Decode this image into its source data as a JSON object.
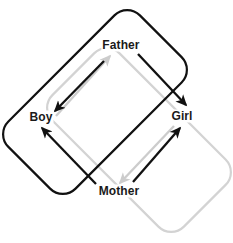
{
  "diagram": {
    "type": "relationship-diagram",
    "background_color": "#ffffff",
    "nodes": [
      {
        "id": "father",
        "label": "Father",
        "x": 121,
        "y": 45
      },
      {
        "id": "boy",
        "label": "Boy",
        "x": 41,
        "y": 117
      },
      {
        "id": "girl",
        "label": "Girl",
        "x": 182,
        "y": 116
      },
      {
        "id": "mother",
        "label": "Mother",
        "x": 119,
        "y": 191
      }
    ],
    "groups": [
      {
        "id": "black-group",
        "color": "#111111",
        "stroke_width": 2.2,
        "rotation_deg": -45,
        "corner_radius": 18,
        "center_x": 95,
        "center_y": 102,
        "width": 186,
        "height": 95
      },
      {
        "id": "gray-group",
        "color": "#d3d3d3",
        "stroke_width": 2.2,
        "rotation_deg": 45,
        "corner_radius": 18,
        "center_x": 139,
        "center_y": 140,
        "width": 186,
        "height": 95
      }
    ],
    "edges": [
      {
        "id": "father-to-boy",
        "from": "Father",
        "to": "Boy",
        "color": "#111111",
        "style": "solid-arrow"
      },
      {
        "id": "boy-to-father",
        "from": "Boy",
        "to": "Father",
        "color": "#cccccc",
        "style": "solid-arrow"
      },
      {
        "id": "father-to-girl",
        "from": "Father",
        "to": "Girl",
        "color": "#111111",
        "style": "solid-arrow"
      },
      {
        "id": "mother-to-boy",
        "from": "Mother",
        "to": "Boy",
        "color": "#111111",
        "style": "solid-arrow"
      },
      {
        "id": "mother-to-girl",
        "from": "Mother",
        "to": "Girl",
        "color": "#111111",
        "style": "solid-arrow"
      },
      {
        "id": "girl-to-mother",
        "from": "Girl",
        "to": "Mother",
        "color": "#cccccc",
        "style": "solid-arrow"
      }
    ],
    "colors": {
      "black": "#111111",
      "gray_box": "#d3d3d3",
      "gray_arrow": "#cccccc",
      "text": "#1a1a1a"
    }
  }
}
